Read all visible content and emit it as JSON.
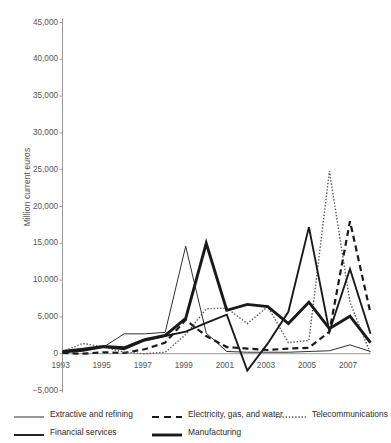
{
  "chart_data": {
    "type": "line",
    "title": "",
    "xlabel": "",
    "ylabel": "Million current euros",
    "ylim": [
      -5000,
      45000
    ],
    "xlim": [
      1993,
      2008
    ],
    "grid": false,
    "legend_position": "bottom",
    "ytick_labels": [
      "45,000",
      "40,000",
      "35,000",
      "30,000",
      "25,000",
      "20,000",
      "15,000",
      "10,000",
      "5,000",
      "0",
      "−5,000"
    ],
    "ytick_values": [
      45000,
      40000,
      35000,
      30000,
      25000,
      20000,
      15000,
      10000,
      5000,
      0,
      -5000
    ],
    "xtick_labels": [
      "1993",
      "1995",
      "1997",
      "1999",
      "2001",
      "2003",
      "2005",
      "2007"
    ],
    "xtick_values": [
      1993,
      1995,
      1997,
      1999,
      2001,
      2003,
      2005,
      2007
    ],
    "x": [
      1993,
      1994,
      1995,
      1996,
      1997,
      1998,
      1999,
      2000,
      2001,
      2002,
      2003,
      2004,
      2005,
      2006,
      2007,
      2008
    ],
    "series": [
      {
        "name": "Extractive and refining",
        "style": "thin-solid",
        "color": "#1a1a1a",
        "values": [
          300,
          500,
          900,
          2700,
          2700,
          2900,
          14600,
          2800,
          300,
          200,
          200,
          200,
          300,
          400,
          1200,
          300
        ]
      },
      {
        "name": "Electricity, gas, and water",
        "style": "dashed",
        "color": "#1a1a1a",
        "values": [
          100,
          0,
          200,
          100,
          600,
          1500,
          4600,
          2400,
          900,
          700,
          500,
          700,
          800,
          3000,
          18000,
          5500
        ]
      },
      {
        "name": "Telecommunications",
        "style": "dotted",
        "color": "#555555",
        "values": [
          300,
          1400,
          900,
          200,
          0,
          200,
          2600,
          6100,
          6200,
          4100,
          6400,
          1500,
          1800,
          24800,
          7000,
          0
        ]
      },
      {
        "name": "Financial services",
        "style": "medium-solid",
        "color": "#1a1a1a",
        "values": [
          200,
          400,
          900,
          600,
          1800,
          2400,
          3000,
          4200,
          5300,
          -2300,
          1400,
          5700,
          17200,
          3000,
          11500,
          2700
        ]
      },
      {
        "name": "Manufacturing",
        "style": "thick-solid",
        "color": "#1a1a1a",
        "values": [
          300,
          600,
          1000,
          800,
          1900,
          2500,
          4800,
          15000,
          5900,
          6700,
          6400,
          4100,
          7000,
          3400,
          5100,
          1500
        ]
      }
    ]
  },
  "legend": {
    "items": [
      {
        "label": "Extractive and refining",
        "style": "thin-solid"
      },
      {
        "label": "Electricity, gas, and water",
        "style": "dashed"
      },
      {
        "label": "Telecommunications",
        "style": "dotted"
      },
      {
        "label": "Financial services",
        "style": "medium-solid"
      },
      {
        "label": "Manufacturing",
        "style": "thick-solid"
      }
    ]
  }
}
